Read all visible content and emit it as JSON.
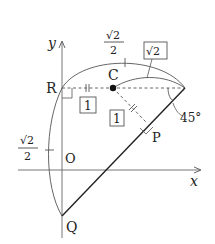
{
  "diagram": {
    "axes": {
      "x_label": "x",
      "y_label": "y",
      "origin_label": "O"
    },
    "points": {
      "R": "R",
      "C": "C",
      "P": "P",
      "Q": "Q"
    },
    "annotations": {
      "top_frac_num": "√2",
      "top_frac_den": "2",
      "left_frac_num": "√2",
      "left_frac_den": "2",
      "boxed_sqrt2": "√2",
      "boxed_one_horizontal": "1",
      "boxed_one_diagonal": "1",
      "angle": "45°"
    },
    "colors": {
      "line": "#222222",
      "thin": "#555555",
      "background": "#ffffff"
    }
  }
}
